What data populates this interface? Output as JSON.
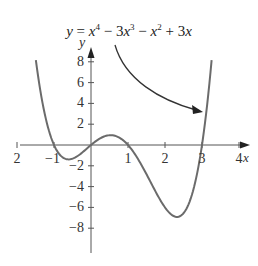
{
  "chart_data": {
    "type": "line",
    "title_parts": {
      "lhs": "y",
      "eq": " = ",
      "t1_base": "x",
      "t1_exp": "4",
      "t2": " − 3",
      "t2_base": "x",
      "t2_exp": "3",
      "t3": " − ",
      "t3_base": "x",
      "t3_exp": "2",
      "t4": " + 3",
      "t4_base": "x"
    },
    "xlabel": "x",
    "ylabel": "y",
    "xlim": [
      -2,
      4
    ],
    "ylim": [
      -8,
      8
    ],
    "x_ticks": [
      -2,
      -1,
      1,
      2,
      3,
      4
    ],
    "x_tick_labels": [
      "2",
      "−1",
      "1",
      "2",
      "3",
      "4"
    ],
    "y_ticks": [
      8,
      6,
      4,
      2,
      -2,
      -4,
      -6,
      -8
    ],
    "y_tick_labels": [
      "8",
      "6",
      "4",
      "2",
      "−2",
      "−4",
      "−6",
      "−8"
    ],
    "grid": false,
    "series": [
      {
        "name": "y = x^4 − 3x^3 − x^2 + 3x",
        "coefficients": [
          1,
          -3,
          -1,
          3,
          0
        ],
        "x_range": [
          -1.49,
          3.26
        ],
        "roots": [
          -1,
          0,
          1,
          3
        ],
        "points": [
          {
            "x": -1.49,
            "y": 8.2
          },
          {
            "x": -1.0,
            "y": 0
          },
          {
            "x": -0.65,
            "y": -1.6
          },
          {
            "x": 0,
            "y": 0
          },
          {
            "x": 0.45,
            "y": 0.9
          },
          {
            "x": 1.0,
            "y": 0
          },
          {
            "x": 2.3,
            "y": -6.9
          },
          {
            "x": 3.0,
            "y": 0
          },
          {
            "x": 3.26,
            "y": 8.0
          }
        ],
        "color": "#6b6b6b"
      }
    ],
    "annotation": {
      "text_ref": "title",
      "arrow_points_to": {
        "x": 3.0,
        "y": 3.2
      }
    }
  },
  "colors": {
    "axis": "#555555",
    "curve": "#6e6e6e",
    "text": "#222222",
    "arrow": "#333333"
  }
}
